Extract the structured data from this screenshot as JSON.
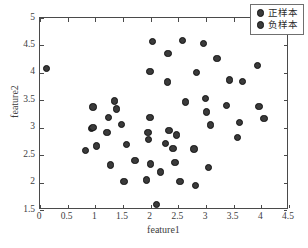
{
  "chart_data": {
    "type": "scatter",
    "title": "",
    "xlabel": "feature1",
    "ylabel": "feature2",
    "xlim": [
      0,
      4.5
    ],
    "ylim": [
      1.5,
      5
    ],
    "xticks": [
      "0",
      "0.5",
      "1",
      "1.5",
      "2",
      "2.5",
      "3",
      "3.5",
      "4",
      "4.5"
    ],
    "xtick_values": [
      0,
      0.5,
      1,
      1.5,
      2,
      2.5,
      3,
      3.5,
      4,
      4.5
    ],
    "yticks": [
      "1.5",
      "2",
      "2.5",
      "3",
      "3.5",
      "4",
      "4.5",
      "5"
    ],
    "ytick_values": [
      1.5,
      2,
      2.5,
      3,
      3.5,
      4,
      4.5,
      5
    ],
    "grid": false,
    "legend_position": "upper-right",
    "marker_color": "#3a3a3a",
    "marker_edge_color": "#111111",
    "series": [
      {
        "name": "正样本",
        "points": [
          [
            0.12,
            4.08
          ],
          [
            0.82,
            2.59
          ],
          [
            0.96,
            3.38
          ],
          [
            0.93,
            2.99
          ],
          [
            0.96,
            3.0
          ],
          [
            1.02,
            2.67
          ],
          [
            1.21,
            2.91
          ],
          [
            1.24,
            3.19
          ],
          [
            1.27,
            2.32
          ],
          [
            1.35,
            3.49
          ],
          [
            1.38,
            3.34
          ],
          [
            1.47,
            3.06
          ],
          [
            1.52,
            2.02
          ],
          [
            1.56,
            2.69
          ],
          [
            1.72,
            2.4
          ],
          [
            1.93,
            2.05
          ],
          [
            1.95,
            2.91
          ],
          [
            1.96,
            2.78
          ],
          [
            1.99,
            3.19
          ],
          [
            1.99,
            4.03
          ],
          [
            2.03,
            4.57
          ],
          [
            2.0,
            2.34
          ],
          [
            2.1,
            1.6
          ],
          [
            2.18,
            2.19
          ],
          [
            2.27,
            2.71
          ],
          [
            2.3,
            3.83
          ],
          [
            2.31,
            4.35
          ]
        ]
      },
      {
        "name": "负样本",
        "points": [
          [
            2.33,
            2.95
          ],
          [
            2.4,
            2.62
          ],
          [
            2.44,
            2.37
          ],
          [
            2.47,
            2.87
          ],
          [
            2.53,
            2.02
          ],
          [
            2.57,
            4.59
          ],
          [
            2.63,
            3.47
          ],
          [
            2.78,
            2.61
          ],
          [
            2.81,
            1.95
          ],
          [
            2.83,
            4.01
          ],
          [
            2.95,
            4.53
          ],
          [
            2.99,
            3.53
          ],
          [
            3.01,
            3.29
          ],
          [
            3.04,
            2.28
          ],
          [
            3.08,
            3.05
          ],
          [
            3.2,
            4.26
          ],
          [
            3.37,
            3.4
          ],
          [
            3.42,
            3.87
          ],
          [
            3.57,
            2.82
          ],
          [
            3.6,
            3.09
          ],
          [
            3.66,
            3.84
          ],
          [
            3.93,
            4.13
          ],
          [
            3.96,
            3.39
          ],
          [
            4.05,
            3.17
          ]
        ]
      }
    ]
  },
  "legend": {
    "items": [
      {
        "label": "正样本"
      },
      {
        "label": "负样本"
      }
    ]
  }
}
